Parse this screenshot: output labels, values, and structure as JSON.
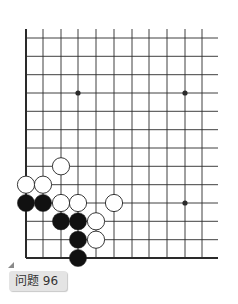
{
  "problem": {
    "label": "问题 96"
  },
  "board": {
    "columns_x": [
      26,
      43,
      61,
      78,
      96,
      114,
      132,
      149,
      167,
      185,
      202
    ],
    "rows_y": [
      38,
      56.3,
      74.7,
      93,
      111.3,
      129.7,
      148,
      166.3,
      184.7,
      203,
      221.3,
      239.7,
      258
    ],
    "line_right_extent": 218,
    "left_edge_top": 29,
    "star_points": [
      [
        3,
        3
      ],
      [
        9,
        3
      ],
      [
        9,
        9
      ]
    ],
    "stones": [
      {
        "color": "white",
        "col": 2,
        "row": 7
      },
      {
        "color": "white",
        "col": 0,
        "row": 8
      },
      {
        "color": "white",
        "col": 1,
        "row": 8
      },
      {
        "color": "black",
        "col": 0,
        "row": 9
      },
      {
        "color": "black",
        "col": 1,
        "row": 9
      },
      {
        "color": "white",
        "col": 2,
        "row": 9
      },
      {
        "color": "white",
        "col": 3,
        "row": 9
      },
      {
        "color": "white",
        "col": 5,
        "row": 9
      },
      {
        "color": "black",
        "col": 2,
        "row": 10
      },
      {
        "color": "black",
        "col": 3,
        "row": 10
      },
      {
        "color": "white",
        "col": 4,
        "row": 10
      },
      {
        "color": "black",
        "col": 3,
        "row": 11
      },
      {
        "color": "white",
        "col": 4,
        "row": 11
      },
      {
        "color": "black",
        "col": 3,
        "row": 12
      }
    ],
    "colors": {
      "line": "#2a2a2a",
      "black_stone": "#111111",
      "white_stone": "#ffffff"
    }
  }
}
